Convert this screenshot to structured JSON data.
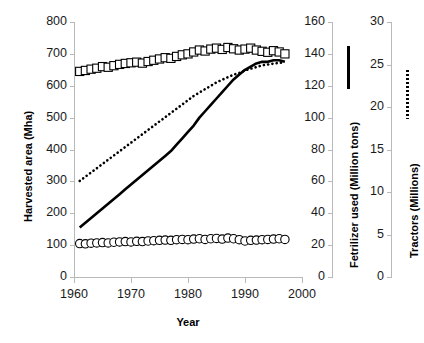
{
  "chart_data": {
    "type": "line",
    "title": "",
    "xlabel": "Year",
    "xlim": [
      1960,
      2000
    ],
    "xticks": [
      1960,
      1970,
      1980,
      1990,
      2000
    ],
    "grid": false,
    "legend_position": "right-axis-swatches",
    "axes": [
      {
        "id": "left",
        "label": "Harvested area (Mha)",
        "side": "left",
        "lim": [
          0,
          800
        ],
        "ticks": [
          0,
          100,
          200,
          300,
          400,
          500,
          600,
          700,
          800
        ]
      },
      {
        "id": "right1",
        "label": "Fetrilizer used (Million tons)",
        "side": "right",
        "lim": [
          0,
          160
        ],
        "ticks": [
          0,
          20,
          40,
          60,
          80,
          100,
          120,
          140,
          160
        ]
      },
      {
        "id": "right2",
        "label": "Tractors (Millions)",
        "side": "right",
        "lim": [
          0,
          30
        ],
        "ticks": [
          0,
          5,
          10,
          15,
          20,
          25,
          30
        ]
      }
    ],
    "x": [
      1961,
      1962,
      1963,
      1964,
      1965,
      1966,
      1967,
      1968,
      1969,
      1970,
      1971,
      1972,
      1973,
      1974,
      1975,
      1976,
      1977,
      1978,
      1979,
      1980,
      1981,
      1982,
      1983,
      1984,
      1985,
      1986,
      1987,
      1988,
      1989,
      1990,
      1991,
      1992,
      1993,
      1994,
      1995,
      1996,
      1997
    ],
    "series": [
      {
        "name": "Harvested area (Mha)",
        "axis": "left",
        "marker": "open-square",
        "style": "markers",
        "values": [
          645,
          648,
          652,
          655,
          660,
          658,
          663,
          667,
          670,
          672,
          674,
          671,
          676,
          680,
          684,
          688,
          686,
          692,
          697,
          700,
          706,
          712,
          709,
          715,
          718,
          714,
          720,
          716,
          712,
          715,
          718,
          712,
          708,
          705,
          710,
          706,
          700
        ]
      },
      {
        "name": "Harvested area secondary (Mha)",
        "axis": "left",
        "marker": "open-circle",
        "style": "markers",
        "values": [
          105,
          104,
          106,
          107,
          108,
          107,
          109,
          110,
          111,
          110,
          112,
          111,
          113,
          114,
          115,
          116,
          115,
          117,
          118,
          117,
          119,
          120,
          118,
          120,
          121,
          119,
          122,
          120,
          117,
          113,
          115,
          116,
          117,
          118,
          119,
          120,
          118
        ]
      },
      {
        "name": "Fetrilizer used (Million tons)",
        "axis": "right1",
        "marker": "none",
        "style": "solid-line",
        "values": [
          31,
          34,
          37,
          40,
          43,
          46,
          49,
          52,
          55,
          58,
          61,
          64,
          67,
          70,
          73,
          76,
          79,
          83,
          87,
          91,
          95,
          100,
          104,
          108,
          112,
          116,
          120,
          124,
          127,
          130,
          132,
          134,
          135,
          135,
          136,
          136,
          135
        ]
      },
      {
        "name": "Tractors (Millions)",
        "axis": "right2",
        "marker": "none",
        "style": "dotted-line",
        "values": [
          11.3,
          11.8,
          12.3,
          12.8,
          13.3,
          13.8,
          14.3,
          14.8,
          15.3,
          15.8,
          16.3,
          16.8,
          17.3,
          17.8,
          18.3,
          18.8,
          19.3,
          19.8,
          20.3,
          20.8,
          21.3,
          21.7,
          22.1,
          22.5,
          22.9,
          23.2,
          23.5,
          23.8,
          24.0,
          24.3,
          24.5,
          24.7,
          24.9,
          25.0,
          25.1,
          25.2,
          25.2
        ]
      }
    ]
  }
}
